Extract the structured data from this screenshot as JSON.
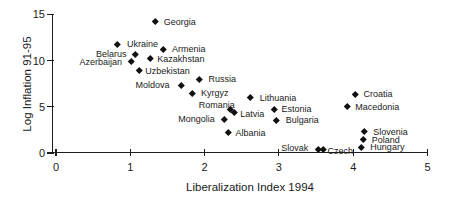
{
  "chart_data": {
    "type": "scatter",
    "xlabel": "Liberalization Index 1994",
    "ylabel": "Log Inflation 91-95",
    "xlim": [
      0,
      5
    ],
    "ylim": [
      0,
      15
    ],
    "x_ticks": [
      0,
      1,
      2,
      3,
      4,
      5
    ],
    "y_ticks": [
      0,
      5,
      10,
      15
    ],
    "grid": false,
    "legend": "none",
    "marker": "diamond",
    "colors": {
      "marker": "#111111",
      "axis": "#1f1f1f",
      "text": "#1a1a1a",
      "background": "#ffffff"
    },
    "points": [
      {
        "label": "Georgia",
        "x": 1.33,
        "y": 14.2,
        "label_side": "right",
        "dx": 9,
        "dy": 0
      },
      {
        "label": "Ukraine",
        "x": 0.82,
        "y": 11.8,
        "label_side": "right",
        "dx": 10,
        "dy": 0
      },
      {
        "label": "Armenia",
        "x": 1.44,
        "y": 11.2,
        "label_side": "right",
        "dx": 9,
        "dy": 0
      },
      {
        "label": "Belarus",
        "x": 1.07,
        "y": 10.7,
        "label_side": "left",
        "dx": -9,
        "dy": 0
      },
      {
        "label": "Kazakhstan",
        "x": 1.27,
        "y": 10.2,
        "label_side": "right",
        "dx": 7,
        "dy": 0
      },
      {
        "label": "Azerbaijan",
        "x": 1.01,
        "y": 9.9,
        "label_side": "left",
        "dx": -9,
        "dy": 1
      },
      {
        "label": "Uzbekistan",
        "x": 1.12,
        "y": 8.9,
        "label_side": "right",
        "dx": 6,
        "dy": 0
      },
      {
        "label": "Russia",
        "x": 1.93,
        "y": 8.0,
        "label_side": "right",
        "dx": 9,
        "dy": 0
      },
      {
        "label": "Moldova",
        "x": 1.69,
        "y": 7.35,
        "label_side": "left",
        "dx": -12,
        "dy": 0
      },
      {
        "label": "Kyrgyz",
        "x": 1.83,
        "y": 6.5,
        "label_side": "right",
        "dx": 9,
        "dy": 0
      },
      {
        "label": "Lithuania",
        "x": 2.62,
        "y": 6.0,
        "label_side": "right",
        "dx": 9,
        "dy": 0
      },
      {
        "label": "Romania",
        "x": 2.34,
        "y": 4.7,
        "label_side": "left",
        "dx": 5,
        "dy": -5
      },
      {
        "label": "Latvia",
        "x": 2.4,
        "y": 4.4,
        "label_side": "right",
        "dx": 6,
        "dy": 2
      },
      {
        "label": "Mongolia",
        "x": 2.27,
        "y": 3.65,
        "label_side": "left",
        "dx": -10,
        "dy": 0
      },
      {
        "label": "Albania",
        "x": 2.32,
        "y": 2.2,
        "label_side": "right",
        "dx": 7,
        "dy": 0
      },
      {
        "label": "Estonia",
        "x": 2.94,
        "y": 4.75,
        "label_side": "right",
        "dx": 7,
        "dy": 0
      },
      {
        "label": "Bulgaria",
        "x": 2.97,
        "y": 3.55,
        "label_side": "right",
        "dx": 9,
        "dy": 0
      },
      {
        "label": "Croatia",
        "x": 4.03,
        "y": 6.4,
        "label_side": "right",
        "dx": 8,
        "dy": 0
      },
      {
        "label": "Macedonia",
        "x": 3.92,
        "y": 5.0,
        "label_side": "right",
        "dx": 8,
        "dy": 0
      },
      {
        "label": "Slovenia",
        "x": 4.15,
        "y": 2.3,
        "label_side": "right",
        "dx": 9,
        "dy": 0
      },
      {
        "label": "Poland",
        "x": 4.13,
        "y": 1.45,
        "label_side": "right",
        "dx": 9,
        "dy": 0
      },
      {
        "label": "Hungary",
        "x": 4.11,
        "y": 0.6,
        "label_side": "right",
        "dx": 9,
        "dy": 0
      },
      {
        "label": "Slovak",
        "x": 3.53,
        "y": 0.42,
        "label_side": "left",
        "dx": -10,
        "dy": -1
      },
      {
        "label": "Czech",
        "x": 3.6,
        "y": 0.35,
        "label_side": "right",
        "dx": 4,
        "dy": 1
      }
    ]
  }
}
